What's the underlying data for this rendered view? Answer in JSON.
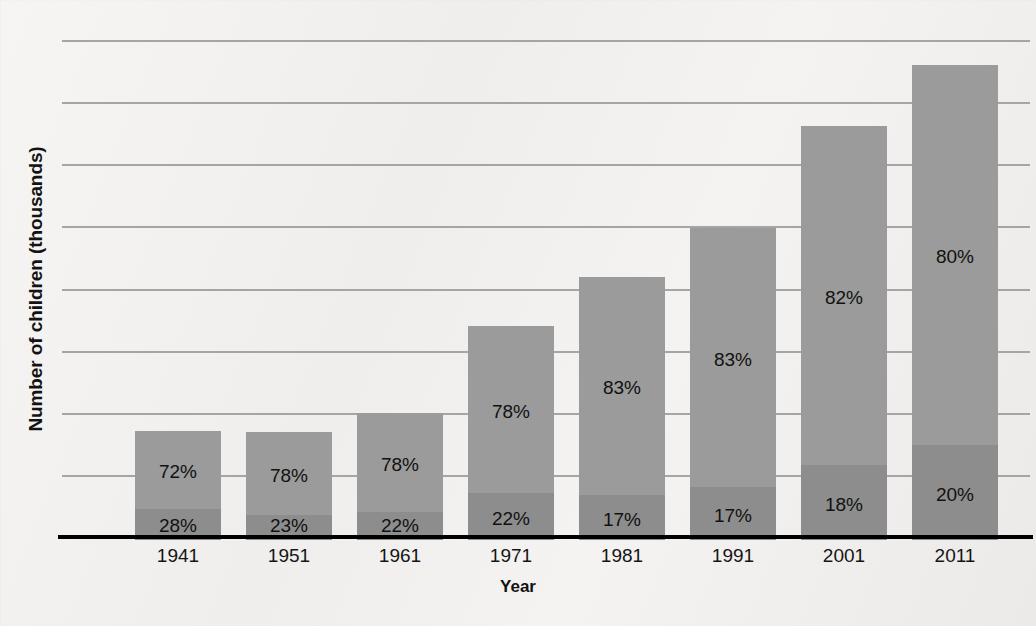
{
  "chart_data": {
    "type": "bar",
    "subtype": "stacked-bar",
    "title": "",
    "xlabel": "Year",
    "ylabel": "Number of children (thousands)",
    "categories": [
      "1941",
      "1951",
      "1961",
      "1971",
      "1981",
      "1991",
      "2001",
      "2011"
    ],
    "totals": [
      440,
      435,
      510,
      860,
      1060,
      1255,
      1665,
      1910
    ],
    "ylim": [
      0,
      2000
    ],
    "ytick_values": [
      0,
      250,
      500,
      750,
      1000,
      1250,
      1500,
      1750,
      2000
    ],
    "ytick_labels": [
      "0",
      "250",
      "500",
      "750",
      "1,000",
      "1,250",
      "1,500",
      "1,750",
      "2,000"
    ],
    "grid": true,
    "legend": null,
    "series": [
      {
        "name": "lower-segment",
        "color": "#8d8d8d",
        "values": [
          123,
          100,
          112,
          189,
          180,
          213,
          300,
          382
        ],
        "labels": [
          "28%",
          "23%",
          "22%",
          "22%",
          "17%",
          "17%",
          "18%",
          "20%"
        ]
      },
      {
        "name": "upper-segment",
        "color": "#9b9b9b",
        "values": [
          317,
          335,
          398,
          671,
          880,
          1042,
          1365,
          1528
        ],
        "labels": [
          "72%",
          "78%",
          "78%",
          "78%",
          "83%",
          "83%",
          "82%",
          "80%"
        ]
      }
    ]
  },
  "axis": {
    "y_title": "Number of children (thousands)",
    "x_title": "Year"
  }
}
